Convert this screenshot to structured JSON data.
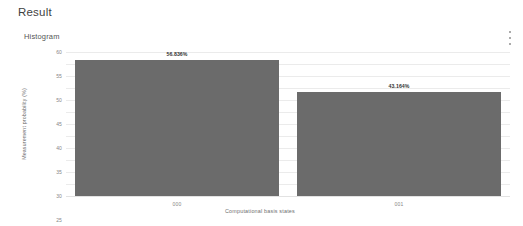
{
  "header": {
    "title": "Result"
  },
  "panel": {
    "subtitle": "Histogram",
    "menu_icon": "kebab-menu-icon"
  },
  "chart_data": {
    "type": "bar",
    "title": "Histogram",
    "categories": [
      "000",
      "001"
    ],
    "values": [
      56.836,
      43.164
    ],
    "value_labels": [
      "56.836%",
      "43.164%"
    ],
    "xlabel": "Computational basis states",
    "ylabel": "Measurement probability (%)",
    "ylim": [
      0,
      60
    ],
    "yticks": [
      60,
      55,
      50,
      45,
      40,
      35,
      30,
      25,
      20,
      15,
      10,
      5,
      0
    ],
    "ytick_labels": [
      "60",
      "55",
      "50",
      "45",
      "40",
      "35",
      "30",
      "25",
      "20",
      "15",
      "10",
      "5",
      "0"
    ],
    "grid": true,
    "legend": false,
    "bar_color": "#6b6b6b",
    "grid_color": "#ebebeb"
  }
}
